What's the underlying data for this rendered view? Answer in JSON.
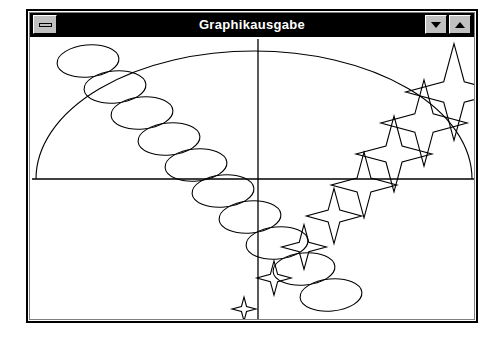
{
  "window": {
    "title": "Graphikausgabe",
    "system_menu_label": "System menu",
    "minimize_label": "Minimize",
    "maximize_label": "Maximize",
    "frame": {
      "x": 26,
      "y": 9,
      "width": 452,
      "height": 314
    },
    "titlebar_bg": "#000000",
    "titlebar_fg": "#ffffff",
    "button_face": "#c0c0c0",
    "canvas_bg": "#ffffff",
    "stroke": "#000000"
  },
  "chart_data": {
    "type": "scatter",
    "title": "Graphikausgabe",
    "xlabel": "",
    "ylabel": "",
    "grid": false,
    "legend": null,
    "viewbox": {
      "width": 448,
      "height": 286
    },
    "axes": {
      "horizontal": {
        "y": 142,
        "x1": 2,
        "x2": 446
      },
      "vertical": {
        "x": 228,
        "y1": 2,
        "y2": 284
      }
    },
    "arc": {
      "shape": "semicircle",
      "center_x": 224,
      "center_y": 142,
      "radius_x": 218,
      "radius_y": 128,
      "start_angle_deg": 180,
      "end_angle_deg": 360
    },
    "ellipses": {
      "count": 10,
      "rx": 31,
      "ry": 16,
      "step_x": 27,
      "step_y": 26,
      "start_x": 58,
      "start_y": 24,
      "rotation_deg": -5
    },
    "stars": {
      "count": 8,
      "points": 4,
      "start_x": 214,
      "start_y": 272,
      "step_x": 30,
      "step_y": -31,
      "start_radius": 12,
      "radius_growth": 5.2,
      "inner_ratio": 0.3
    }
  }
}
